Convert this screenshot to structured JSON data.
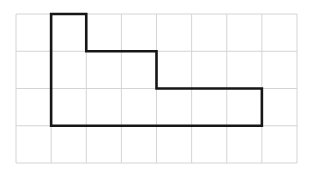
{
  "figure": {
    "background_color": "#ffffff"
  },
  "grid": {
    "name": "square-grid",
    "columns": 8,
    "rows": 4,
    "origin_x": 16,
    "origin_y": 14,
    "cell_width": 35.125,
    "cell_height": 37.25,
    "line_color": "#d4d4d4",
    "line_width": 1
  },
  "shape": {
    "name": "staircase-polygon",
    "stroke_color": "#161616",
    "stroke_width": 2.6,
    "fill": "none",
    "closed": true,
    "vertices_grid": [
      [
        1,
        0
      ],
      [
        2,
        0
      ],
      [
        2,
        1
      ],
      [
        4,
        1
      ],
      [
        4,
        2
      ],
      [
        7,
        2
      ],
      [
        7,
        3
      ],
      [
        1,
        3
      ]
    ],
    "vertex_labels": [
      "top-left",
      "top-right",
      "step1-right-down",
      "step1-right",
      "step2-down",
      "step2-right",
      "bottom-right",
      "bottom-left"
    ],
    "area_cells": 12,
    "perimeter_cells": 20
  },
  "chart_data": {
    "type": "table",
    "xlabel": "",
    "ylabel": "",
    "categories": [
      "columns",
      "rows",
      "vertices",
      "area (unit squares)",
      "perimeter (units)"
    ],
    "values": [
      8,
      4,
      8,
      12,
      20
    ]
  }
}
